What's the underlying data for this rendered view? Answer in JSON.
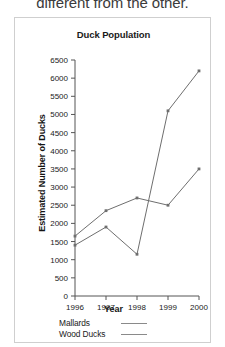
{
  "page": {
    "cutoff_sentence": "different from the other."
  },
  "chart_data": {
    "type": "line",
    "title": "Duck Population",
    "xlabel": "Year",
    "ylabel": "Estimated Number of Ducks",
    "x": [
      1996,
      1997,
      1998,
      1999,
      2000
    ],
    "xtick_labels": [
      "1996",
      "1997",
      "1998",
      "1999",
      "2000"
    ],
    "ylim": [
      0,
      6500
    ],
    "ytick_values": [
      0,
      500,
      1000,
      1500,
      2000,
      2500,
      3000,
      3500,
      4000,
      4500,
      5000,
      5500,
      6000,
      6500
    ],
    "ytick_labels": [
      "0",
      "500",
      "1000",
      "1500",
      "2000",
      "2500",
      "3000",
      "3500",
      "4000",
      "4500",
      "5000",
      "5500",
      "6000",
      "6500"
    ],
    "grid": false,
    "legend_position": "below-plot",
    "series": [
      {
        "name": "Mallards",
        "values": [
          1650,
          2350,
          2700,
          2500,
          3500
        ],
        "color": "#6e6e6e"
      },
      {
        "name": "Wood Ducks",
        "values": [
          1400,
          1900,
          1150,
          5100,
          6200
        ],
        "color": "#6e6e6e"
      }
    ]
  },
  "legend": {
    "items": [
      {
        "label": "Mallards"
      },
      {
        "label": "Wood Ducks"
      }
    ]
  },
  "colors": {
    "frame": "#cfcfcf",
    "axis": "#555555",
    "line": "#6e6e6e",
    "text": "#1a1a1a"
  }
}
